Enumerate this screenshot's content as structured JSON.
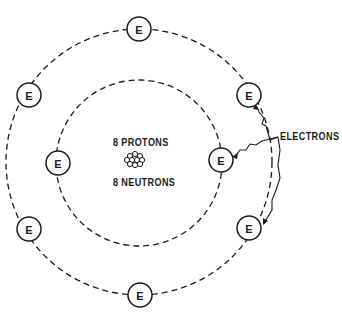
{
  "diagram": {
    "nucleus": {
      "protons_label": "8 PROTONS",
      "neutrons_label": "8 NEUTRONS"
    },
    "electron_symbol": "E",
    "callout_label": "ELECTRONS",
    "shells": [
      {
        "name": "inner",
        "electron_count": 2
      },
      {
        "name": "outer",
        "electron_count": 6
      }
    ],
    "colors": {
      "line": "#1a1a1a",
      "background": "#ffffff"
    }
  }
}
